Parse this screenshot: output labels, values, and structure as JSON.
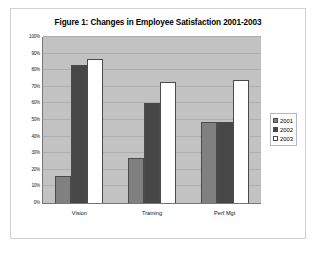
{
  "chart_data": {
    "type": "bar",
    "title": "Figure 1: Changes in Employee Satisfaction 2001-2003",
    "xlabel": "",
    "ylabel": "",
    "categories": [
      "Vision",
      "Training",
      "Perf Mgt"
    ],
    "series": [
      {
        "name": "2001",
        "color": "#808080",
        "values": [
          16,
          27,
          49
        ]
      },
      {
        "name": "2002",
        "color": "#474747",
        "values": [
          83,
          60,
          49
        ]
      },
      {
        "name": "2003",
        "color": "#ffffff",
        "values": [
          87,
          73,
          74
        ]
      }
    ],
    "ylim": [
      0,
      100
    ],
    "ytick_labels": [
      "100%",
      "90%",
      "80%",
      "70%",
      "60%",
      "50%",
      "40%",
      "30%",
      "20%",
      "10%",
      "0%"
    ],
    "ytick_values": [
      100,
      90,
      80,
      70,
      60,
      50,
      40,
      30,
      20,
      10,
      0
    ],
    "grid": true,
    "legend_position": "right",
    "plot_background": "#c2c2c2",
    "gridline_color": "#aeaeae"
  }
}
